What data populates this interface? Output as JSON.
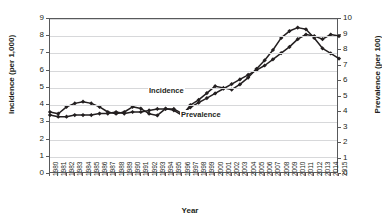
{
  "chart_data": {
    "type": "line",
    "title": "",
    "xlabel": "Year",
    "ylabel": "Incidence (per 1,000)",
    "ylabel_right": "Prevalence (per 100)",
    "ylim": [
      0,
      9
    ],
    "ylim_right": [
      0,
      10
    ],
    "yticks": [
      "0",
      "1",
      "2",
      "3",
      "4",
      "5",
      "6",
      "7",
      "8",
      "9"
    ],
    "yticks_right": [
      "0",
      "1",
      "2",
      "3",
      "4",
      "5",
      "6",
      "7",
      "8",
      "9",
      "10"
    ],
    "grid": true,
    "legend_position": "inline-annotation",
    "categories": [
      "1980",
      "1981",
      "1982",
      "1983",
      "1984",
      "1985",
      "1986",
      "1987",
      "1988",
      "1989",
      "1990",
      "1991",
      "1992",
      "1993",
      "1994",
      "1995",
      "1996",
      "1997",
      "1998",
      "1999",
      "2000",
      "2001",
      "2002",
      "2003",
      "2004",
      "2005",
      "2006",
      "2007",
      "2008",
      "2009",
      "2010",
      "2011",
      "2012",
      "2013",
      "2014",
      "2015"
    ],
    "series": [
      {
        "name": "Incidence",
        "axis": "left",
        "unit": "per 1,000",
        "values": [
          3.6,
          3.5,
          3.9,
          4.1,
          4.2,
          4.1,
          3.9,
          3.6,
          3.5,
          3.6,
          3.9,
          3.8,
          3.5,
          3.4,
          3.8,
          3.7,
          3.4,
          4.0,
          4.3,
          4.7,
          5.1,
          5.0,
          4.9,
          5.2,
          5.6,
          6.1,
          6.6,
          7.2,
          7.9,
          8.3,
          8.5,
          8.4,
          7.9,
          7.3,
          7.0,
          6.7
        ]
      },
      {
        "name": "Prevalence",
        "axis": "right",
        "unit": "per 100",
        "values": [
          3.8,
          3.7,
          3.7,
          3.8,
          3.8,
          3.8,
          3.9,
          3.9,
          4.0,
          3.9,
          4.0,
          4.0,
          4.1,
          4.2,
          4.2,
          4.2,
          3.9,
          4.3,
          4.6,
          4.9,
          5.2,
          5.5,
          5.8,
          6.1,
          6.4,
          6.7,
          7.0,
          7.4,
          7.8,
          8.2,
          8.7,
          9.0,
          8.9,
          8.7,
          9.0,
          8.9
        ]
      }
    ],
    "annotations": [
      {
        "text": "Incidence",
        "series": "Incidence"
      },
      {
        "text": "Prevalence",
        "series": "Prevalence"
      }
    ]
  },
  "colors": {
    "line": "#231f20",
    "grid": "#d7d8da",
    "frame": "#58595b",
    "background": "#ffffff"
  }
}
